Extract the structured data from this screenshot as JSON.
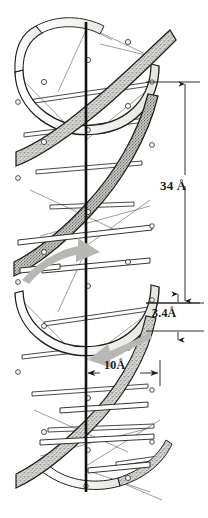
{
  "figure": {
    "background_color": "#ffffff",
    "ink_color": "#1a1a1a",
    "ribbon_light_color": "#f2f1ee",
    "ribbon_dark_color": "#9b9a96",
    "stipple_color": "#6e6d69",
    "arrow_color": "#b3b2ae",
    "axis_color": "#111111"
  },
  "annotations": {
    "pitch": {
      "name": "helix-pitch-dimension",
      "value": "34",
      "unit": "Å",
      "label": "34 Å",
      "meaning": "full helical turn pitch"
    },
    "rise": {
      "name": "base-rise-dimension",
      "value": "3.4",
      "unit": "Å",
      "label": "3.4Å",
      "meaning": "rise per base pair"
    },
    "diameter": {
      "name": "helix-radius-dimension",
      "value": "10",
      "unit": "Å",
      "label": "10Å",
      "meaning": "helix radius"
    }
  },
  "strand_arrows": [
    {
      "name": "strand-direction-arrow-up",
      "direction": "up-right",
      "color": "#b3b2ae"
    },
    {
      "name": "strand-direction-arrow-down",
      "direction": "down-left",
      "color": "#b3b2ae"
    }
  ],
  "geometry": {
    "axis_x": 86,
    "helix_left": 14,
    "helix_right": 159,
    "helix_top": 22,
    "helix_bottom": 492,
    "pitch_px": 221,
    "radius_px": 72
  }
}
